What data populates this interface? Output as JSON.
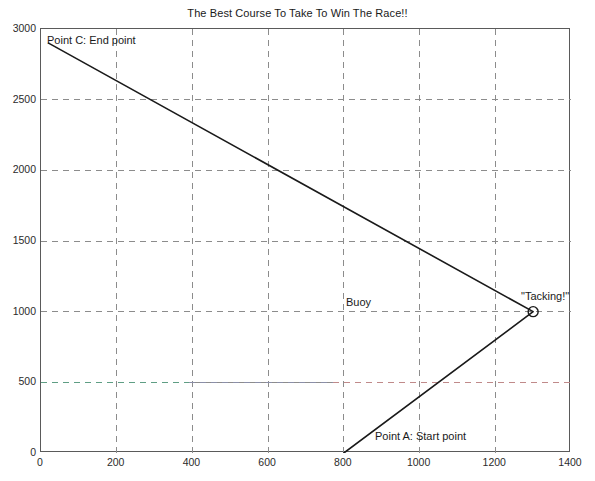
{
  "chart_data": {
    "type": "line",
    "title": "The Best Course To Take To Win The Race!!",
    "xlabel": "",
    "ylabel": "",
    "xlim": [
      0,
      1400
    ],
    "ylim": [
      0,
      3000
    ],
    "xticks": [
      0,
      200,
      400,
      600,
      800,
      1000,
      1200,
      1400
    ],
    "yticks": [
      0,
      500,
      1000,
      1500,
      2000,
      2500,
      3000
    ],
    "grid": true,
    "legend": "none",
    "series": [
      {
        "name": "course",
        "type": "line",
        "color": "#1a1a1a",
        "linewidth": 1.6,
        "points": [
          {
            "x": 800,
            "y": 0
          },
          {
            "x": 1300,
            "y": 1000
          },
          {
            "x": 20,
            "y": 2900
          }
        ]
      },
      {
        "name": "buoy-line",
        "type": "hline",
        "y": 1000,
        "color": "#b14fb1",
        "style": "dashed"
      },
      {
        "name": "reference-line-500",
        "type": "hline",
        "y": 500,
        "color": "#5f9e84",
        "color_right": "#c08080",
        "style": "dashed"
      }
    ],
    "markers": [
      {
        "name": "tacking-marker",
        "x": 1300,
        "y": 1000,
        "shape": "circle",
        "color": "#1a1a1a"
      }
    ],
    "annotations": [
      {
        "name": "point-c",
        "text": "Point C: End point",
        "x": 50,
        "y": 2930
      },
      {
        "name": "point-a",
        "text": "Point A: Start point",
        "x": 885,
        "y": 110
      },
      {
        "name": "buoy",
        "text": "Buoy",
        "x": 810,
        "y": 1090
      },
      {
        "name": "tacking",
        "text": "\"Tacking!\"",
        "x": 1275,
        "y": 1135
      }
    ]
  },
  "colors": {
    "axis": "#5a5a5a",
    "grid": "#8c8c8c",
    "line": "#1a1a1a",
    "buoy": "#b14fb1",
    "ref_left": "#5f9e84",
    "ref_right": "#c08080",
    "text": "#1a1a1a",
    "background": "#ffffff"
  }
}
